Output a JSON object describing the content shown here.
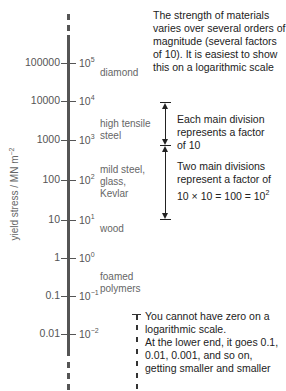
{
  "diagram": {
    "type": "logarithmic-scale",
    "axis_label": {
      "text": "yield stress / MN m",
      "exponent": "−2"
    },
    "ticks": [
      {
        "decimal": "100000",
        "power_base": "10",
        "power_exp": "5"
      },
      {
        "decimal": "10000",
        "power_base": "10",
        "power_exp": "4"
      },
      {
        "decimal": "1000",
        "power_base": "10",
        "power_exp": "3"
      },
      {
        "decimal": "100",
        "power_base": "10",
        "power_exp": "2"
      },
      {
        "decimal": "10",
        "power_base": "10",
        "power_exp": "1"
      },
      {
        "decimal": "1",
        "power_base": "10",
        "power_exp": "0"
      },
      {
        "decimal": "0.1",
        "power_base": "10",
        "power_exp": "−1"
      },
      {
        "decimal": "0.01",
        "power_base": "10",
        "power_exp": "−2"
      }
    ],
    "materials": [
      {
        "line1": "diamond",
        "line2": "",
        "line3": ""
      },
      {
        "line1": "high tensile",
        "line2": "steel",
        "line3": ""
      },
      {
        "line1": "mild steel,",
        "line2": "glass,",
        "line3": "Kevlar"
      },
      {
        "line1": "wood",
        "line2": "",
        "line3": ""
      },
      {
        "line1": "foamed",
        "line2": "polymers",
        "line3": ""
      }
    ],
    "notes": {
      "intro": [
        "The strength of materials",
        "varies over several orders of",
        "magnitude (several factors",
        "of 10). It is easiest to show",
        "this on a logarithmic scale"
      ],
      "one_division": [
        "Each main division",
        "represents a factor",
        "of 10"
      ],
      "two_divisions": [
        "Two main divisions",
        "represent a factor of",
        "10 × 10 = 100 = 10"
      ],
      "two_divisions_exp": "2",
      "zero": [
        "You cannot have zero on a",
        "logarithmic scale.",
        "At the lower end, it goes 0.1,",
        "0.01, 0.001, and so on,",
        "getting smaller and smaller"
      ]
    },
    "colors": {
      "axis": "#555555",
      "text": "#222222",
      "label": "#666666"
    }
  }
}
